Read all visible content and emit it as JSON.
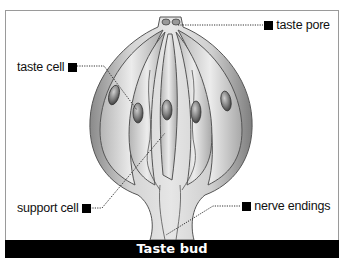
{
  "diagram": {
    "title": "Taste bud",
    "labels": {
      "taste_pore": "taste pore",
      "taste_cell": "taste cell",
      "support_cell": "support cell",
      "nerve_endings": "nerve endings"
    },
    "colors": {
      "caption_bg": "#000000",
      "caption_text": "#ffffff",
      "frame_border": "#9a9a9a",
      "illustration_base": "#c8c8c8",
      "leader_line": "#333333"
    }
  }
}
